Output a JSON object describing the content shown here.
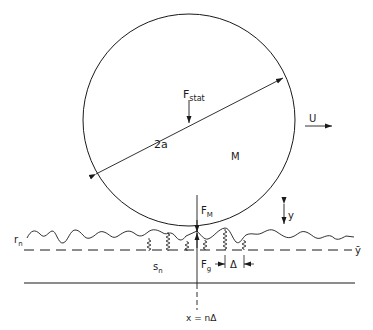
{
  "diagram": {
    "kind": "rolling sphere on rough surface model",
    "labels": {
      "static_force": "F",
      "static_force_sub": "stat",
      "diameter": "2a",
      "mass": "M",
      "velocity": "U",
      "contact_force": "F",
      "contact_force_sub": "M",
      "displacement": "y",
      "roughness": "r",
      "roughness_sub": "n",
      "mean_height": "ȳ",
      "spring": "s",
      "spring_sub": "n",
      "ground_force": "F",
      "ground_force_sub": "g",
      "spacing": "Δ",
      "position": "x = nΔ"
    },
    "colors": {
      "line": "#1a1a1a",
      "background": "#ffffff"
    }
  }
}
